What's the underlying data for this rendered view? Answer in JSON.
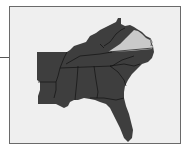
{
  "figure": {
    "type": "locator-map",
    "region": "Southeastern United States",
    "highlighted_state": "Virginia",
    "states_shown": [
      "Arkansas",
      "Louisiana",
      "Mississippi",
      "Alabama",
      "Georgia",
      "Florida",
      "Tennessee",
      "Kentucky",
      "West Virginia",
      "Virginia",
      "North Carolina",
      "South Carolina"
    ],
    "colors": {
      "background": "#efefef",
      "frame_border": "#6a6a6a",
      "states_fill": "#3e3e3e",
      "state_borders": "#111111",
      "highlight_fill": "#c9c9c9"
    }
  }
}
